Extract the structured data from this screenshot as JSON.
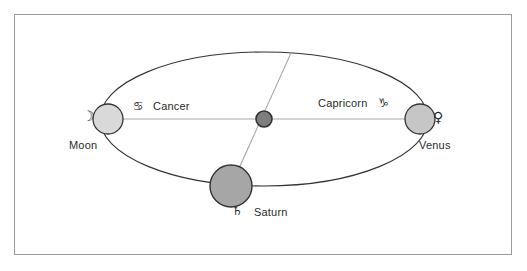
{
  "diagram": {
    "frame": {
      "border_color": "#9a9a9a",
      "background": "#ffffff"
    },
    "orbit": {
      "shape": "ellipse",
      "center_x": 264,
      "center_y": 119,
      "radius_x": 164,
      "radius_y": 67,
      "stroke_color": "#333333"
    },
    "axis_line": {
      "from": "Moon",
      "to": "Venus",
      "color": "#a8a8a8"
    },
    "aspect_line": {
      "from": "orbit-top",
      "to": "Saturn",
      "color": "#a8a8a8"
    },
    "center_body": {
      "name": "center-node",
      "fill": "#7e7e7e",
      "stroke": "#333333",
      "radius": 8
    },
    "bodies": [
      {
        "id": "moon",
        "label": "Moon",
        "glyph": "☽",
        "glyph_name": "moon-glyph",
        "fill": "#d9d9d9",
        "stroke": "#333333",
        "radius": 15,
        "cx": 108,
        "cy": 119
      },
      {
        "id": "venus",
        "label": "Venus",
        "glyph": "♀",
        "glyph_name": "venus-glyph",
        "fill": "#c6c6c6",
        "stroke": "#333333",
        "radius": 15,
        "cx": 420,
        "cy": 119
      },
      {
        "id": "saturn",
        "label": "Saturn",
        "glyph": "♄",
        "glyph_name": "saturn-glyph",
        "fill": "#a6a6a6",
        "stroke": "#333333",
        "radius": 21,
        "cx": 231,
        "cy": 186
      }
    ],
    "signs": [
      {
        "id": "cancer",
        "label": "Cancer",
        "glyph": "♋",
        "glyph_name": "cancer-glyph",
        "side": "left"
      },
      {
        "id": "capricorn",
        "label": "Capricorn",
        "glyph": "♑",
        "glyph_name": "capricorn-glyph",
        "side": "right"
      }
    ]
  }
}
